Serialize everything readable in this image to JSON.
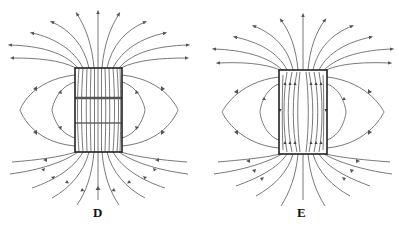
{
  "figure": {
    "panels": [
      {
        "id": "D",
        "label": "D",
        "description": "Bar magnet / solenoid with field lines exiting top and entering bottom; inside lines run parallel vertically with horizontal bands",
        "box": {
          "x": 75,
          "y": 68,
          "width": 47,
          "height": 84
        }
      },
      {
        "id": "E",
        "label": "E",
        "description": "Bar magnet with field lines exiting top and entering bottom; inside lines curve outward and point upward",
        "box": {
          "x": 279,
          "y": 70,
          "width": 48,
          "height": 84
        }
      }
    ],
    "colors": {
      "field_line": "#6a6a6a",
      "outline": "#222222",
      "label": "#111111",
      "background": "#ffffff"
    }
  }
}
